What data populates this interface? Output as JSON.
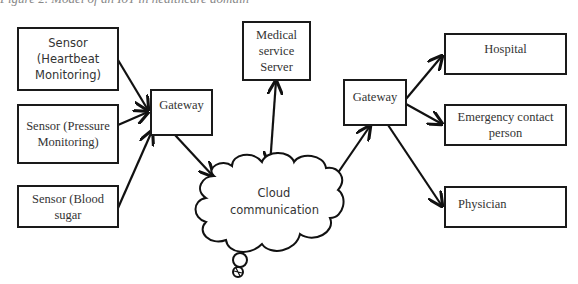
{
  "caption": "Figure 2. Model of an IoT in healthcare domain",
  "nodes": {
    "sensor_heartbeat": "Sensor (Heartbeat Monitoring)",
    "sensor_pressure": "Sensor (Pressure Monitoring)",
    "sensor_blood": "Sensor (Blood sugar",
    "gateway_left": "Gateway",
    "medical_server": "Medical service Server",
    "cloud": "Cloud communication",
    "gateway_right": "Gateway",
    "hospital": "Hospital",
    "emergency": "Emergency contact person",
    "physician": "Physician"
  },
  "edges": [
    {
      "from": "Sensor (Heartbeat Monitoring)",
      "to": "Gateway (left)"
    },
    {
      "from": "Sensor (Pressure Monitoring)",
      "to": "Gateway (left)"
    },
    {
      "from": "Sensor (Blood sugar",
      "to": "Gateway (left)"
    },
    {
      "from": "Gateway (left)",
      "to": "Cloud communication"
    },
    {
      "from": "Medical service Server",
      "to": "Cloud communication",
      "bidirectional": true
    },
    {
      "from": "Cloud communication",
      "to": "Gateway (right)"
    },
    {
      "from": "Gateway (right)",
      "to": "Hospital"
    },
    {
      "from": "Gateway (right)",
      "to": "Emergency contact person"
    },
    {
      "from": "Gateway (right)",
      "to": "Physician"
    }
  ]
}
